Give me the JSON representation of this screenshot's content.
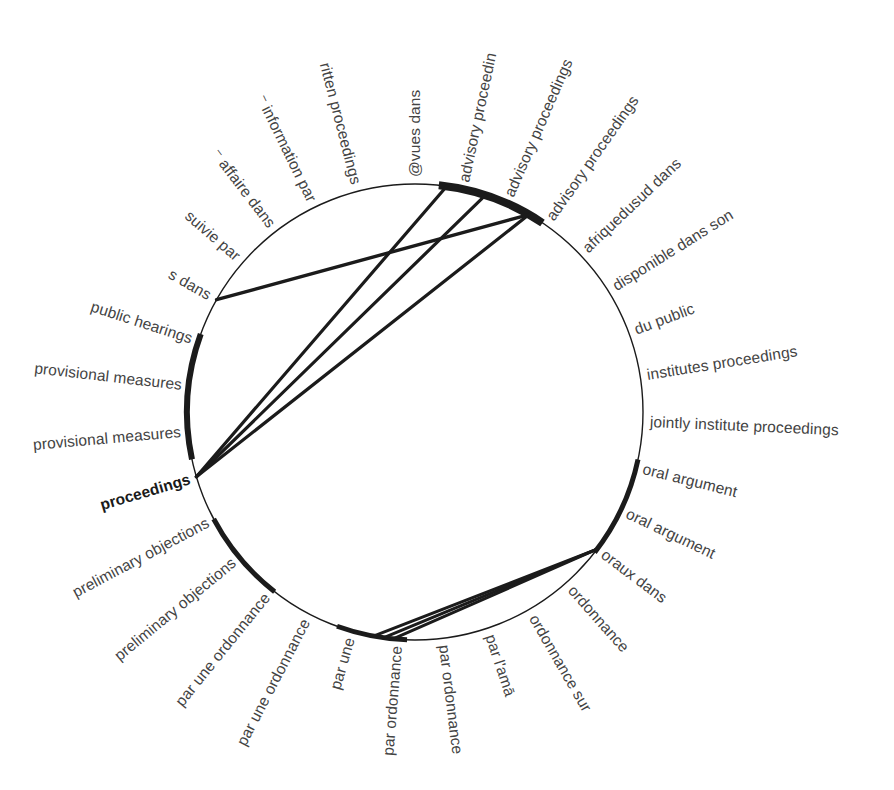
{
  "figure": {
    "type": "chord-diagram",
    "background_color": "#ffffff",
    "stroke_color": "#1b1b1b",
    "label_color": "#434343",
    "circle": {
      "cx": 415,
      "cy": 412,
      "r": 228
    }
  },
  "chart_data": {
    "type": "chord",
    "title": "",
    "xlabel": "",
    "ylabel": "",
    "legend": [],
    "grid": false,
    "nodes": [
      {
        "index": 0,
        "label": "@vues dans",
        "angle_deg": -90.0,
        "side": "right"
      },
      {
        "index": 1,
        "label": "advisory proceedin",
        "angle_deg": -78.0,
        "side": "right"
      },
      {
        "index": 2,
        "label": "advisory proceedings",
        "angle_deg": -66.5,
        "side": "right"
      },
      {
        "index": 3,
        "label": "advisory proceedings",
        "angle_deg": -55.0,
        "side": "right"
      },
      {
        "index": 4,
        "label": "afriquedusud dans",
        "angle_deg": -43.5,
        "side": "right"
      },
      {
        "index": 5,
        "label": "disponible dans son",
        "angle_deg": -32.0,
        "side": "right"
      },
      {
        "index": 6,
        "label": "du public",
        "angle_deg": -20.5,
        "side": "right"
      },
      {
        "index": 7,
        "label": "institutes proceedings",
        "angle_deg": -9.0,
        "side": "right"
      },
      {
        "index": 8,
        "label": "jointly institute proceedings",
        "angle_deg": 2.5,
        "side": "right"
      },
      {
        "index": 9,
        "label": "oral argument",
        "angle_deg": 14.0,
        "side": "right"
      },
      {
        "index": 10,
        "label": "oral argument",
        "angle_deg": 25.5,
        "side": "right"
      },
      {
        "index": 11,
        "label": "oraux dans",
        "angle_deg": 37.0,
        "side": "right"
      },
      {
        "index": 12,
        "label": "ordonnance",
        "angle_deg": 48.5,
        "side": "right"
      },
      {
        "index": 13,
        "label": "ordonnance sur",
        "angle_deg": 60.0,
        "side": "right"
      },
      {
        "index": 14,
        "label": "par l'amā",
        "angle_deg": 71.5,
        "side": "right"
      },
      {
        "index": 15,
        "label": "par ordonnance",
        "angle_deg": 83.0,
        "side": "right"
      },
      {
        "index": 16,
        "label": "par ordonnance",
        "angle_deg": 94.5,
        "side": "left"
      },
      {
        "index": 17,
        "label": "par une",
        "angle_deg": 106.0,
        "side": "left"
      },
      {
        "index": 18,
        "label": "par une ordonnance",
        "angle_deg": 117.5,
        "side": "left"
      },
      {
        "index": 19,
        "label": "par une ordonnance",
        "angle_deg": 129.0,
        "side": "left"
      },
      {
        "index": 20,
        "label": "preliminary objections",
        "angle_deg": 140.5,
        "side": "left"
      },
      {
        "index": 21,
        "label": "preliminary objections",
        "angle_deg": 152.0,
        "side": "left"
      },
      {
        "index": 22,
        "label": "proceedings",
        "angle_deg": 163.5,
        "side": "left",
        "bold": true
      },
      {
        "index": 23,
        "label": "provisional measures",
        "angle_deg": 175.0,
        "side": "left"
      },
      {
        "index": 24,
        "label": "provisional measures",
        "angle_deg": 186.5,
        "side": "left"
      },
      {
        "index": 25,
        "label": "public hearings",
        "angle_deg": 198.0,
        "side": "left"
      },
      {
        "index": 26,
        "label": "s dans",
        "angle_deg": 209.5,
        "side": "left"
      },
      {
        "index": 27,
        "label": "suivie par",
        "angle_deg": 221.0,
        "side": "left"
      },
      {
        "index": 28,
        "label": "⁻ affaire dans",
        "angle_deg": 232.5,
        "side": "left"
      },
      {
        "index": 29,
        "label": "⁻ information par",
        "angle_deg": 244.0,
        "side": "left"
      },
      {
        "index": 30,
        "label": "ritten proceedings",
        "angle_deg": 255.5,
        "side": "left"
      },
      {
        "index": 31,
        "label": "⁻⁻⁻",
        "angle_deg": 267.0,
        "side": "left",
        "hidden": true
      }
    ],
    "ribbons": [
      {
        "from_angle_deg": -82.0,
        "to_angle_deg": 163.5,
        "width": 3.2
      },
      {
        "from_angle_deg": -72.0,
        "to_angle_deg": 163.5,
        "width": 3.2
      },
      {
        "from_angle_deg": -60.0,
        "to_angle_deg": 163.5,
        "width": 3.2
      },
      {
        "from_angle_deg": -60.0,
        "to_angle_deg": 209.5,
        "width": 3.4
      },
      {
        "from_angle_deg": 37.0,
        "to_angle_deg": 100.5,
        "width": 3.0
      },
      {
        "from_angle_deg": 37.0,
        "to_angle_deg": 98.0,
        "width": 3.0
      },
      {
        "from_angle_deg": 37.0,
        "to_angle_deg": 95.5,
        "width": 3.0
      }
    ],
    "arc_segments": [
      {
        "start_deg": -84.0,
        "end_deg": -56.0,
        "thickness": 8
      },
      {
        "start_deg": 12.0,
        "end_deg": 38.0,
        "thickness": 5
      },
      {
        "start_deg": 92.0,
        "end_deg": 110.0,
        "thickness": 5
      },
      {
        "start_deg": 128.0,
        "end_deg": 152.0,
        "thickness": 5
      },
      {
        "start_deg": 168.0,
        "end_deg": 200.0,
        "thickness": 6
      }
    ]
  }
}
